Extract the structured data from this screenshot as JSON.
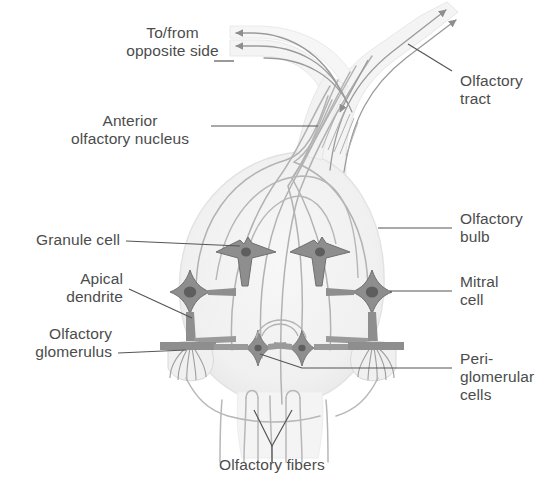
{
  "figure": {
    "colors": {
      "text": "#4c4c4c",
      "leader_line": "#555555",
      "bulb_fill": "#f2f2f2",
      "bulb_edge": "#e2e2e2",
      "neuron_fill": "#8e8e8e",
      "neuron_edge": "#6f6f6f",
      "nucleus": "#5e5e5e",
      "fiber": "#b9b9b9",
      "tract_fill": "#f4f4f4",
      "background": "#ffffff"
    }
  },
  "labels": {
    "to_from_opposite_side": "To/from\nopposite side",
    "anterior_olfactory_nucleus": "Anterior\nolfactory nucleus",
    "granule_cell": "Granule cell",
    "apical_dendrite": "Apical\ndendrite",
    "olfactory_glomerulus": "Olfactory\nglomerulus",
    "olfactory_tract": "Olfactory\ntract",
    "olfactory_bulb": "Olfactory\nbulb",
    "mitral_cell": "Mitral\ncell",
    "periglomerular_cells": "Peri-\nglomerular\ncells",
    "olfactory_fibers": "Olfactory fibers"
  },
  "structures": {
    "mitral_cells": 2,
    "granule_cells": 2,
    "periglomerular_cells": 2,
    "glomeruli": 2,
    "tract_arrowheads_outgoing": 2,
    "tract_arrowheads_incoming": 2
  }
}
